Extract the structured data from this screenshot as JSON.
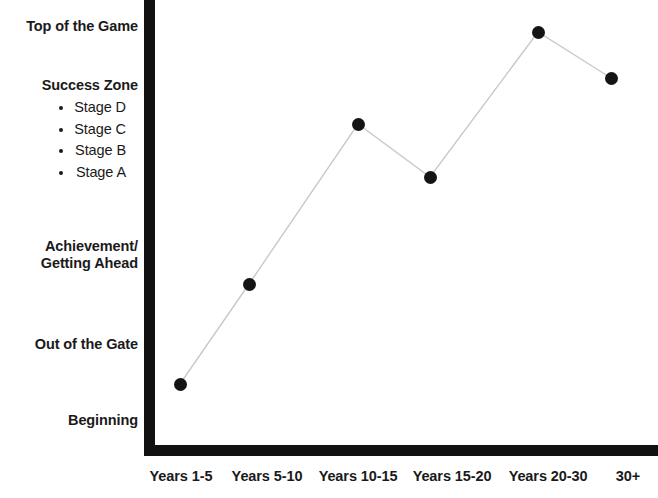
{
  "chart_data": {
    "type": "line",
    "title": "",
    "xlabel": "",
    "ylabel": "",
    "grid": false,
    "legend": "none",
    "categories": [
      "Years 1-5",
      "Years 5-10",
      "Years 10-15",
      "Years 15-20",
      "Years 20-30",
      "30+"
    ],
    "y_tick_labels": [
      "Beginning",
      "Out of the Gate",
      "Achievement/\nGetting Ahead",
      "Success Zone",
      "Top of the Game"
    ],
    "y_tick_values": [
      1,
      2,
      3,
      5,
      7
    ],
    "ylim": [
      0,
      7.4
    ],
    "series": [
      {
        "name": "Career Progression",
        "values": [
          1.45,
          2.9,
          5.2,
          4.45,
          6.85,
          6.18
        ],
        "point_labels": [
          "Beginning / Out of the Gate",
          "Achievement / Getting Ahead",
          "Success Zone - Stage C",
          "Success Zone - Stage B",
          "Top of the Game",
          "Success Zone - Stage D"
        ],
        "marker": "circle",
        "marker_color": "#141414",
        "line_color": "#c9c9c9"
      }
    ],
    "points_px": [
      {
        "x": 180,
        "y": 384
      },
      {
        "x": 249,
        "y": 284
      },
      {
        "x": 358,
        "y": 124
      },
      {
        "x": 430,
        "y": 177
      },
      {
        "x": 538,
        "y": 32
      },
      {
        "x": 611,
        "y": 78
      }
    ]
  },
  "axes": {
    "y_axis_name": "Career Stage",
    "x_axis_name": "Years of Experience",
    "axis_color": "#111111"
  },
  "y_labels": [
    {
      "id": "top-of-the-game",
      "text": "Top of the Game",
      "top": 18,
      "bold": true
    },
    {
      "id": "achievement",
      "text": "Achievement/\nGetting Ahead",
      "top": 238,
      "bold": true
    },
    {
      "id": "out-of-the-gate",
      "text": "Out of the Gate",
      "top": 336,
      "bold": true
    },
    {
      "id": "beginning",
      "text": "Beginning",
      "top": 412,
      "bold": true
    }
  ],
  "success_zone": {
    "title": "Success Zone",
    "top": 77,
    "stages": [
      {
        "id": "stage-d",
        "label": "Stage D"
      },
      {
        "id": "stage-c",
        "label": "Stage C"
      },
      {
        "id": "stage-b",
        "label": "Stage B"
      },
      {
        "id": "stage-a",
        "label": "Stage A"
      }
    ]
  },
  "x_labels": [
    {
      "id": "years-1-5",
      "text": "Years 1-5",
      "x": 181
    },
    {
      "id": "years-5-10",
      "text": "Years 5-10",
      "x": 267
    },
    {
      "id": "years-10-15",
      "text": "Years 10-15",
      "x": 358
    },
    {
      "id": "years-15-20",
      "text": "Years 15-20",
      "x": 452
    },
    {
      "id": "years-20-30",
      "text": "Years 20-30",
      "x": 548
    },
    {
      "id": "30-plus",
      "text": "30+",
      "x": 628
    }
  ],
  "colors": {
    "background": "#ffffff",
    "axis": "#111111",
    "text": "#1a1a1a",
    "marker": "#141414",
    "line": "#c9c9c9"
  }
}
